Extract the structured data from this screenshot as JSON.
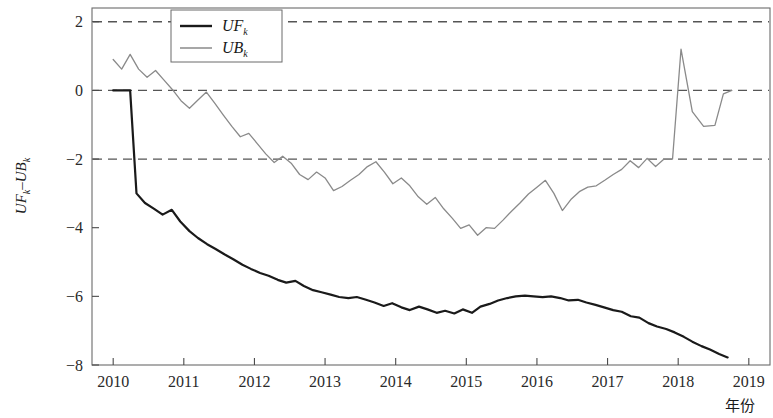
{
  "chart_data": {
    "type": "line",
    "title": "",
    "xlabel": "年份",
    "ylabel": "UF_k−UB_k",
    "ylabel_parts": {
      "f1": "UF",
      "sub1": "k",
      "dash": "–",
      "f2": "UB",
      "sub2": "k"
    },
    "xlim": [
      2009.7,
      2019.3
    ],
    "ylim": [
      -8,
      2.4
    ],
    "xticks": [
      2010,
      2011,
      2012,
      2013,
      2014,
      2015,
      2016,
      2017,
      2018,
      2019
    ],
    "xticklabels": [
      "2010",
      "2011",
      "2012",
      "2013",
      "2014",
      "2015",
      "2016",
      "2017",
      "2018",
      "2019"
    ],
    "yticks": [
      2,
      0,
      -2,
      -4,
      -6,
      -8
    ],
    "yticklabels": [
      "2",
      "0",
      "−2",
      "−4",
      "−6",
      "−8"
    ],
    "grid": false,
    "reference_lines": [
      {
        "value": 2,
        "style": "dashed",
        "color": "#555555"
      },
      {
        "value": 0,
        "style": "dashed",
        "color": "#555555"
      },
      {
        "value": -2,
        "style": "dashed",
        "color": "#555555"
      }
    ],
    "legend": {
      "position": "top-center",
      "entries": [
        {
          "name": "UF_k",
          "base": "UF",
          "sub": "k",
          "color": "#1a1a1a",
          "width": 2.2
        },
        {
          "name": "UB_k",
          "base": "UB",
          "sub": "k",
          "color": "#8a8a8a",
          "width": 1.3
        }
      ]
    },
    "series": [
      {
        "name": "UF_k",
        "color": "#1a1a1a",
        "width": 2.2,
        "x": [
          2010.0,
          2010.12,
          2010.24,
          2010.33,
          2010.45,
          2010.58,
          2010.7,
          2010.83,
          2010.95,
          2011.08,
          2011.2,
          2011.33,
          2011.45,
          2011.58,
          2011.7,
          2011.83,
          2011.95,
          2012.08,
          2012.2,
          2012.33,
          2012.45,
          2012.58,
          2012.7,
          2012.83,
          2012.95,
          2013.08,
          2013.2,
          2013.33,
          2013.45,
          2013.58,
          2013.7,
          2013.83,
          2013.95,
          2014.08,
          2014.2,
          2014.33,
          2014.45,
          2014.58,
          2014.7,
          2014.83,
          2014.95,
          2015.08,
          2015.2,
          2015.33,
          2015.45,
          2015.58,
          2015.7,
          2015.83,
          2015.95,
          2016.08,
          2016.2,
          2016.33,
          2016.45,
          2016.58,
          2016.7,
          2016.83,
          2016.95,
          2017.08,
          2017.2,
          2017.33,
          2017.45,
          2017.58,
          2017.7,
          2017.83,
          2017.95,
          2018.08,
          2018.2,
          2018.33,
          2018.45,
          2018.58,
          2018.7
        ],
        "y": [
          0.0,
          0.0,
          0.0,
          -3.0,
          -3.28,
          -3.45,
          -3.62,
          -3.48,
          -3.82,
          -4.1,
          -4.3,
          -4.48,
          -4.62,
          -4.78,
          -4.92,
          -5.08,
          -5.2,
          -5.32,
          -5.4,
          -5.52,
          -5.6,
          -5.55,
          -5.7,
          -5.82,
          -5.88,
          -5.95,
          -6.02,
          -6.05,
          -6.02,
          -6.1,
          -6.18,
          -6.28,
          -6.2,
          -6.32,
          -6.4,
          -6.3,
          -6.38,
          -6.48,
          -6.42,
          -6.5,
          -6.38,
          -6.48,
          -6.3,
          -6.22,
          -6.12,
          -6.05,
          -6.0,
          -5.98,
          -6.0,
          -6.02,
          -6.0,
          -6.05,
          -6.12,
          -6.1,
          -6.18,
          -6.25,
          -6.32,
          -6.4,
          -6.45,
          -6.58,
          -6.62,
          -6.78,
          -6.88,
          -6.95,
          -7.05,
          -7.18,
          -7.32,
          -7.45,
          -7.55,
          -7.68,
          -7.78
        ]
      },
      {
        "name": "UB_k",
        "color": "#8a8a8a",
        "width": 1.3,
        "x": [
          2010.0,
          2010.12,
          2010.24,
          2010.36,
          2010.48,
          2010.6,
          2010.72,
          2010.84,
          2010.96,
          2011.08,
          2011.2,
          2011.32,
          2011.44,
          2011.56,
          2011.68,
          2011.8,
          2011.92,
          2012.04,
          2012.16,
          2012.28,
          2012.4,
          2012.52,
          2012.64,
          2012.76,
          2012.88,
          2013.0,
          2013.12,
          2013.24,
          2013.36,
          2013.48,
          2013.6,
          2013.72,
          2013.84,
          2013.96,
          2014.08,
          2014.2,
          2014.32,
          2014.44,
          2014.56,
          2014.68,
          2014.8,
          2014.92,
          2015.04,
          2015.16,
          2015.28,
          2015.4,
          2015.52,
          2015.64,
          2015.76,
          2015.88,
          2016.0,
          2016.12,
          2016.24,
          2016.36,
          2016.48,
          2016.6,
          2016.72,
          2016.84,
          2016.96,
          2017.08,
          2017.2,
          2017.32,
          2017.44,
          2017.56,
          2017.68,
          2017.8,
          2017.92,
          2018.04,
          2018.2,
          2018.36,
          2018.52,
          2018.64,
          2018.76
        ],
        "y": [
          0.9,
          0.62,
          1.05,
          0.62,
          0.38,
          0.58,
          0.3,
          0.02,
          -0.3,
          -0.52,
          -0.28,
          -0.05,
          -0.38,
          -0.72,
          -1.05,
          -1.35,
          -1.25,
          -1.55,
          -1.85,
          -2.1,
          -1.92,
          -2.12,
          -2.45,
          -2.6,
          -2.38,
          -2.55,
          -2.92,
          -2.8,
          -2.62,
          -2.45,
          -2.22,
          -2.08,
          -2.38,
          -2.72,
          -2.55,
          -2.78,
          -3.1,
          -3.32,
          -3.12,
          -3.45,
          -3.72,
          -4.02,
          -3.92,
          -4.22,
          -4.0,
          -4.02,
          -3.78,
          -3.52,
          -3.28,
          -3.02,
          -2.82,
          -2.62,
          -3.0,
          -3.5,
          -3.18,
          -2.95,
          -2.82,
          -2.78,
          -2.62,
          -2.45,
          -2.3,
          -2.05,
          -2.25,
          -1.98,
          -2.22,
          -2.0,
          -2.0,
          1.2,
          -0.62,
          -1.05,
          -1.02,
          -0.1,
          0.0
        ]
      }
    ]
  }
}
